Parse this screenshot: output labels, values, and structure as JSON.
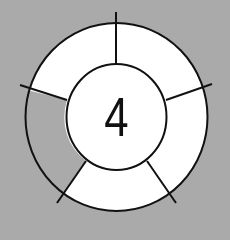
{
  "diagram": {
    "center_number": "4",
    "segments": [
      {
        "name": "top-right",
        "fill": "white"
      },
      {
        "name": "right",
        "fill": "white"
      },
      {
        "name": "bottom",
        "fill": "white"
      },
      {
        "name": "left",
        "fill": "gray"
      },
      {
        "name": "top-left",
        "fill": "white"
      }
    ],
    "colors": {
      "background": "#aaaaaa",
      "segment_white": "#ffffff",
      "segment_gray": "#aaaaaa",
      "stroke": "#111111"
    }
  }
}
